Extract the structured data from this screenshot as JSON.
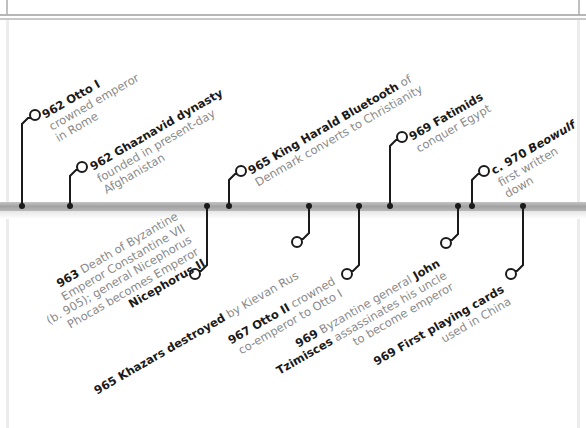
{
  "timeline": {
    "colors": {
      "axis": "#a8a8a8",
      "connector": "#1a1a1a",
      "title_text": "#1a1a1a",
      "body_text": "#8a8a8a"
    },
    "events_above": [
      {
        "year": "962",
        "title": "Otto I",
        "lines": [
          "crowned emperor",
          "in Rome"
        ]
      },
      {
        "year": "962",
        "title": "Ghaznavid dynasty",
        "lines": [
          "founded in present-day",
          "Afghanistan"
        ]
      },
      {
        "year": "965",
        "title": "King Harald Bluetooth",
        "title_suffix": " of",
        "lines": [
          "Denmark converts to Christianity"
        ]
      },
      {
        "year": "969",
        "title": "Fatimids",
        "lines": [
          "conquer Egypt"
        ]
      },
      {
        "year": "c. 970",
        "title": "Beowulf",
        "lines": [
          "first written",
          "down"
        ]
      }
    ],
    "events_below": [
      {
        "year": "963",
        "text_lines": [
          "Death of Byzantine",
          "Emperor Constantine VII",
          "(b. 905); general Nicephorus",
          "Phocas becomes Emperor"
        ],
        "bold_tail": "Nicephorus II"
      },
      {
        "year": "965",
        "title": "Khazars destroyed",
        "lines": [
          "by Kievan Rus"
        ]
      },
      {
        "year": "967",
        "title": "Otto II",
        "title_suffix": " crowned",
        "lines": [
          "co-emperor to Otto I"
        ]
      },
      {
        "year": "969",
        "text_first": "Byzantine general ",
        "bold_first": "John",
        "bold_second": "Tzimisces",
        "text_second": " assassinates his uncle",
        "text_third": "to become emperor"
      },
      {
        "year": "969",
        "title": "First playing cards",
        "lines": [
          "used in China"
        ]
      }
    ]
  }
}
